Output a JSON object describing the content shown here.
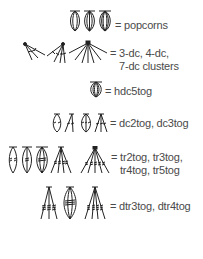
{
  "legend": {
    "rows": [
      {
        "id": "popcorns",
        "symbols": [
          "popcorn-3",
          "popcorn-4",
          "popcorn-5"
        ],
        "label_lines": [
          "= popcorns"
        ]
      },
      {
        "id": "clusters",
        "symbols": [
          "3-dc-cluster",
          "4-dc-cluster",
          "7-dc-cluster"
        ],
        "label_lines": [
          "= 3-dc, 4-dc,",
          "7-dc clusters"
        ]
      },
      {
        "id": "hdc5tog",
        "symbols": [
          "hdc5tog"
        ],
        "label_lines": [
          "= hdc5tog"
        ]
      },
      {
        "id": "dc-tog",
        "symbols": [
          "dc2tog-oval",
          "dc2tog-fan",
          "dc3tog-oval",
          "dc3tog-fan"
        ],
        "label_lines": [
          "= dc2tog, dc3tog"
        ]
      },
      {
        "id": "tr-tog",
        "symbols": [
          "tr2tog-oval",
          "tr3tog-oval",
          "tr4tog-oval",
          "tr-fan-4",
          "tr-fan-5"
        ],
        "label_lines": [
          "= tr2tog, tr3tog,",
          "tr4tog, tr5tog"
        ]
      },
      {
        "id": "dtr-tog",
        "symbols": [
          "dtr3tog-fan",
          "dtr4tog-oval",
          "dtr4tog-fan"
        ],
        "label_lines": [
          "= dtr3tog, dtr4tog"
        ]
      }
    ]
  },
  "colors": {
    "ink": "#222222",
    "text": "#4a4a4a",
    "background": "#ffffff"
  }
}
